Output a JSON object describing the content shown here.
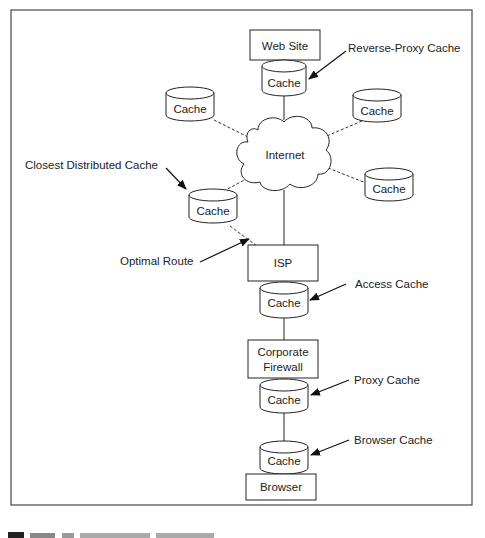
{
  "figure": {
    "caption_visible_fragment": "Figure"
  },
  "nodes": {
    "web_site": "Web Site",
    "reverse_proxy_cache": "Cache",
    "internet": "Internet",
    "peer_cache_top_left": "Cache",
    "peer_cache_top_right": "Cache",
    "peer_cache_right": "Cache",
    "closest_cache": "Cache",
    "isp": "ISP",
    "access_cache": "Cache",
    "corporate_firewall_line1": "Corporate",
    "corporate_firewall_line2": "Firewall",
    "proxy_cache": "Cache",
    "browser_cache": "Cache",
    "browser": "Browser"
  },
  "annotations": {
    "reverse_proxy": "Reverse-Proxy Cache",
    "closest_distributed": "Closest Distributed Cache",
    "optimal_route": "Optimal Route",
    "access": "Access Cache",
    "proxy": "Proxy Cache",
    "browser": "Browser Cache"
  }
}
